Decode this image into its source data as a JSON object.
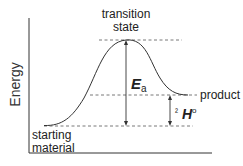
{
  "diagram": {
    "type": "reaction-energy-diagram",
    "y_axis_label": "Energy",
    "labels": {
      "transition_state_line1": "transition",
      "transition_state_line2": "state",
      "product": "product",
      "starting_line1": "starting",
      "starting_line2": "material",
      "ea_main": "E",
      "ea_sub": "a",
      "dh_prefix": "²",
      "dh_main": "H",
      "dh_sup": "o"
    },
    "levels": {
      "starting_material_y": 126,
      "product_y": 95,
      "transition_state_y": 40
    },
    "colors": {
      "line": "#333333",
      "dash": "#555555",
      "text": "#222222"
    }
  }
}
